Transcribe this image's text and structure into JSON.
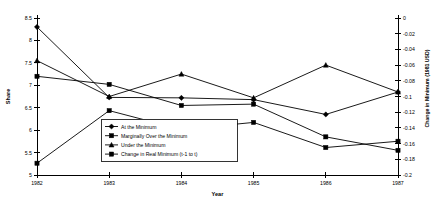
{
  "chart_data": {
    "type": "line",
    "title": "",
    "xlabel": "Year",
    "ylabel": "Share",
    "y2label": "Change in Minimum (1981 USD)",
    "grid": false,
    "legend_position": "center-left-inside",
    "categories": [
      "1982",
      "1983",
      "1984",
      "1985",
      "1986",
      "1987"
    ],
    "x": [
      1982,
      1983,
      1984,
      1985,
      1986,
      1987
    ],
    "ylim": [
      5.0,
      8.5
    ],
    "yticks": [
      "5",
      "5.5",
      "6",
      "6.5",
      "7",
      "7.5",
      "8",
      "8.5"
    ],
    "ytick_values": [
      5,
      5.5,
      6,
      6.5,
      7,
      7.5,
      8,
      8.5
    ],
    "y2lim": [
      -0.2,
      0
    ],
    "y2ticks": [
      "0",
      "-0.02",
      "-0.04",
      "-0.06",
      "-0.08",
      "-0.1",
      "-0.12",
      "-0.14",
      "-0.16",
      "-0.18",
      "-0.2"
    ],
    "y2tick_values": [
      0,
      -0.02,
      -0.04,
      -0.06,
      -0.08,
      -0.1,
      -0.12,
      -0.14,
      -0.16,
      -0.18,
      -0.2
    ],
    "series": [
      {
        "name": "At the Minimum",
        "axis": "left",
        "marker": "diamond",
        "values": [
          8.3,
          6.73,
          6.72,
          6.68,
          6.35,
          6.85
        ]
      },
      {
        "name": "Marginally Over the Minimum",
        "axis": "left",
        "marker": "square",
        "values": [
          7.2,
          7.02,
          6.55,
          6.58,
          5.85,
          5.55
        ]
      },
      {
        "name": "Under the Minimum",
        "axis": "left",
        "marker": "triangle",
        "values": [
          7.55,
          6.75,
          7.25,
          6.72,
          7.45,
          6.85
        ]
      },
      {
        "name": "Change in Real Minimum (t-1 to t)",
        "axis": "right",
        "marker": "square",
        "values": [
          -0.185,
          -0.118,
          -0.142,
          -0.133,
          -0.165,
          -0.157
        ]
      }
    ]
  },
  "legend": {
    "items": [
      {
        "label": "At the Minimum"
      },
      {
        "label": "Marginally Over the Minimum"
      },
      {
        "label": "Under the Minimum"
      },
      {
        "label": "Change in Real Minimum (t-1 to t)"
      }
    ]
  }
}
